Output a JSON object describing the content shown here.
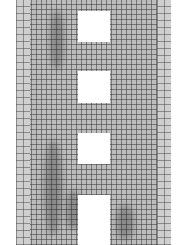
{
  "image": {
    "description": "Grayscale photograph of a tall building facade with a dense grid of windows and four square openings stacked vertically",
    "colors": {
      "facade": "#bdbdbd",
      "grid": "#3c3c3c",
      "opening": "#ffffff"
    },
    "openings": [
      {
        "x": 78,
        "y": 11,
        "w": 32,
        "h": 31
      },
      {
        "x": 78,
        "y": 71,
        "w": 32,
        "h": 32
      },
      {
        "x": 78,
        "y": 133,
        "w": 32,
        "h": 31
      },
      {
        "x": 78,
        "y": 195,
        "w": 32,
        "h": 50
      }
    ]
  }
}
